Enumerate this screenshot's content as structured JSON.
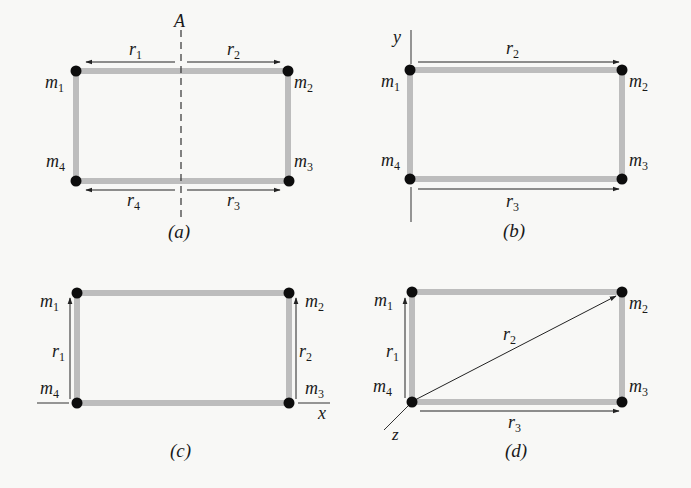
{
  "figure": {
    "colors": {
      "rod": "#bdbdbd",
      "mass": "#0d0d0d",
      "line": "#222222",
      "background": "#f8f8f6"
    },
    "panels": [
      {
        "id": "a",
        "caption": "(a)",
        "axis_label": "A",
        "masses": [
          "m",
          "m",
          "m",
          "m"
        ],
        "mass_subscripts": [
          "1",
          "2",
          "3",
          "4"
        ],
        "vectors": [
          {
            "label": "r",
            "sub": "1"
          },
          {
            "label": "r",
            "sub": "2"
          },
          {
            "label": "r",
            "sub": "3"
          },
          {
            "label": "r",
            "sub": "4"
          }
        ]
      },
      {
        "id": "b",
        "caption": "(b)",
        "axis_label": "y",
        "masses": [
          "m",
          "m",
          "m",
          "m"
        ],
        "mass_subscripts": [
          "1",
          "2",
          "3",
          "4"
        ],
        "vectors": [
          {
            "label": "r",
            "sub": "2"
          },
          {
            "label": "r",
            "sub": "3"
          }
        ]
      },
      {
        "id": "c",
        "caption": "(c)",
        "axis_label": "x",
        "masses": [
          "m",
          "m",
          "m",
          "m"
        ],
        "mass_subscripts": [
          "1",
          "2",
          "3",
          "4"
        ],
        "vectors": [
          {
            "label": "r",
            "sub": "1"
          },
          {
            "label": "r",
            "sub": "2"
          }
        ]
      },
      {
        "id": "d",
        "caption": "(d)",
        "axis_label": "z",
        "masses": [
          "m",
          "m",
          "m",
          "m"
        ],
        "mass_subscripts": [
          "1",
          "2",
          "3",
          "4"
        ],
        "vectors": [
          {
            "label": "r",
            "sub": "1"
          },
          {
            "label": "r",
            "sub": "2"
          },
          {
            "label": "r",
            "sub": "3"
          }
        ]
      }
    ]
  }
}
